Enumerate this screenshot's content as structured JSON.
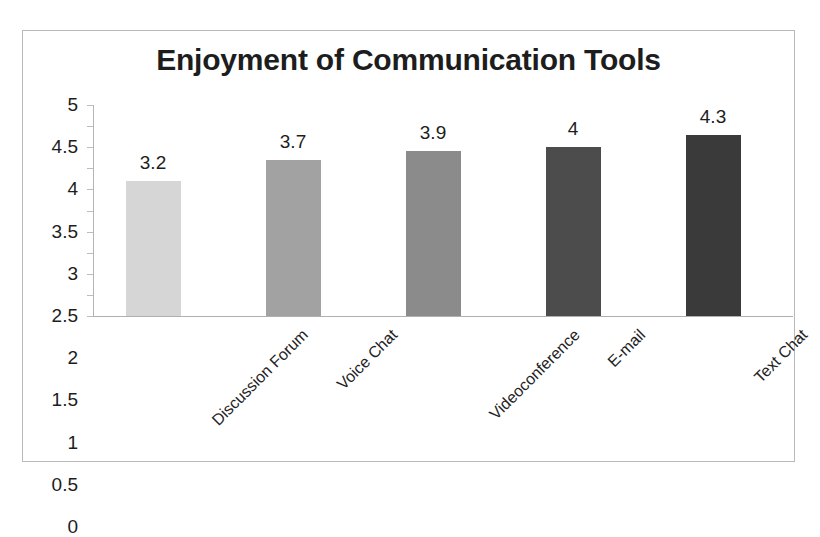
{
  "scan": {
    "top_fragment": ""
  },
  "chart_data": {
    "type": "bar",
    "title": "Enjoyment of Communication Tools",
    "xlabel": "",
    "ylabel": "",
    "categories": [
      "Discussion Forum",
      "Voice Chat",
      "Videoconference",
      "E-mail",
      "Text Chat"
    ],
    "values": [
      3.2,
      3.7,
      3.9,
      4,
      4.3
    ],
    "value_labels": [
      "3.2",
      "3.7",
      "3.9",
      "4",
      "4.3"
    ],
    "bar_colors": [
      "#d6d6d6",
      "#a2a2a2",
      "#8b8b8b",
      "#4c4c4c",
      "#3a3a3a"
    ],
    "ylim": [
      0,
      5
    ],
    "ytick_labels": [
      "5",
      "4.5",
      "4",
      "3.5",
      "3",
      "2.5",
      "2",
      "1.5",
      "1",
      "0.5",
      "0"
    ],
    "ytick_values": [
      5,
      4.5,
      4,
      3.5,
      3,
      2.5,
      2,
      1.5,
      1,
      0.5,
      0
    ],
    "grid": false,
    "legend": false,
    "data_labels": true
  }
}
